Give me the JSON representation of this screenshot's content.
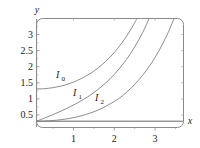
{
  "chart_data": {
    "type": "line",
    "title": "",
    "subtitle": "",
    "xlabel": "x",
    "ylabel": "y",
    "xlim": [
      0,
      3.6
    ],
    "ylim": [
      0,
      3.3
    ],
    "grid": false,
    "legend_position": "inline-annotations",
    "x_ticks": [
      1,
      2,
      3
    ],
    "x_tick_labels": [
      "1",
      "2",
      "3"
    ],
    "y_ticks": [
      0.5,
      1,
      1.5,
      2,
      2.5,
      3
    ],
    "y_tick_labels": [
      "0.5",
      "1",
      "1.5",
      "2",
      "2.5",
      "3"
    ],
    "frame": "rounded-rectangle",
    "curve_color": "#808080",
    "axis_color": "#777777",
    "series": [
      {
        "name": "I0",
        "label_base": "I",
        "label_sub": "0",
        "annotation_x": 0.72,
        "annotation_y": 1.42,
        "x": [
          0,
          0.2,
          0.4,
          0.6,
          0.8,
          1.0,
          1.2,
          1.4,
          1.6,
          1.8,
          2.0,
          2.2,
          2.4,
          2.6,
          2.8
        ],
        "values": [
          1.0,
          1.01,
          1.04,
          1.092,
          1.167,
          1.266,
          1.394,
          1.553,
          1.75,
          1.99,
          2.28,
          2.629,
          3.049,
          3.553,
          4.157
        ]
      },
      {
        "name": "I1",
        "label_base": "I",
        "label_sub": "1",
        "annotation_x": 1.0,
        "annotation_y": 0.84,
        "x": [
          0,
          0.2,
          0.4,
          0.6,
          0.8,
          1.0,
          1.2,
          1.4,
          1.6,
          1.8,
          2.0,
          2.2,
          2.4,
          2.6,
          2.8,
          3.0
        ],
        "values": [
          0.0,
          0.1,
          0.204,
          0.314,
          0.433,
          0.566,
          0.715,
          0.886,
          1.085,
          1.317,
          1.591,
          1.914,
          2.298,
          2.755,
          3.301,
          3.953
        ]
      },
      {
        "name": "I2",
        "label_base": "I",
        "label_sub": "2",
        "annotation_x": 1.42,
        "annotation_y": 0.68,
        "x": [
          0,
          0.2,
          0.4,
          0.6,
          0.8,
          1.0,
          1.2,
          1.4,
          1.6,
          1.8,
          2.0,
          2.2,
          2.4,
          2.6,
          2.8,
          3.0,
          3.2,
          3.4
        ],
        "values": [
          0.0,
          0.005,
          0.02,
          0.046,
          0.084,
          0.136,
          0.204,
          0.291,
          0.4,
          0.538,
          0.689,
          0.893,
          1.136,
          1.427,
          1.774,
          2.189,
          2.685,
          3.278
        ]
      }
    ]
  }
}
